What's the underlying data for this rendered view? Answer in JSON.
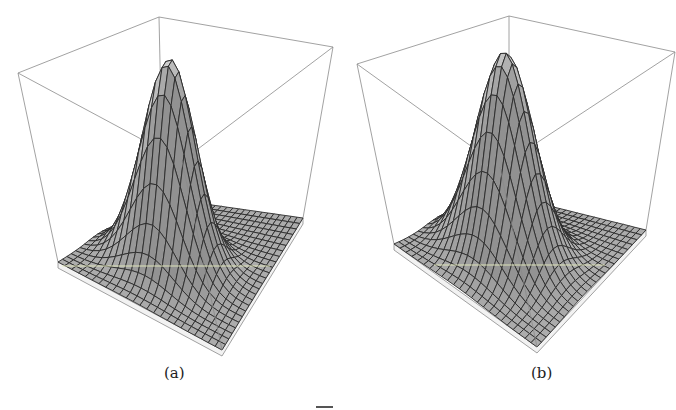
{
  "figure": {
    "panels": [
      {
        "id": "a",
        "caption": "(a)",
        "description": "3D wireframe surface plot of a single Gaussian-like peak inside a bounding box",
        "box": {
          "top_left": [
            18,
            73
          ],
          "top_back": [
            159,
            17
          ],
          "top_right": [
            333,
            47
          ],
          "bottom_left": [
            58,
            262
          ],
          "bottom_front": [
            222,
            350
          ],
          "bottom_right": [
            303,
            218
          ],
          "bottom_back": [
            163,
            198
          ]
        },
        "base_thickness": 6,
        "grid_lines": 24,
        "peak": {
          "u": 0.4,
          "v": 0.55,
          "sigma_u": 0.12,
          "sigma_v": 0.16,
          "height_px": 205
        },
        "highlight_line": {
          "from": [
            62,
            266
          ],
          "to": [
            270,
            266
          ],
          "color": "#e8eec0"
        }
      },
      {
        "id": "b",
        "caption": "(b)",
        "description": "3D wireframe surface plot of a single Gaussian-like peak, slightly broader, inside a bounding box",
        "box": {
          "top_left": [
            357,
            64
          ],
          "top_back": [
            509,
            16
          ],
          "top_right": [
            675,
            52
          ],
          "bottom_left": [
            394,
            244
          ],
          "bottom_front": [
            537,
            347
          ],
          "bottom_right": [
            646,
            230
          ],
          "bottom_back": [
            509,
            196
          ]
        },
        "base_thickness": 6,
        "grid_lines": 24,
        "peak": {
          "u": 0.42,
          "v": 0.55,
          "sigma_u": 0.14,
          "sigma_v": 0.18,
          "height_px": 205
        },
        "highlight_line": {
          "from": [
            434,
            265
          ],
          "to": [
            605,
            265
          ],
          "color": "#e8eec0"
        }
      }
    ],
    "colors": {
      "box_edge": "#8a8a8a",
      "mesh_line": "#2a2a2a",
      "surface_light": "#f4f4f4",
      "surface_dark": "#9a9a9a",
      "base_side": "#f2f2f2"
    }
  }
}
